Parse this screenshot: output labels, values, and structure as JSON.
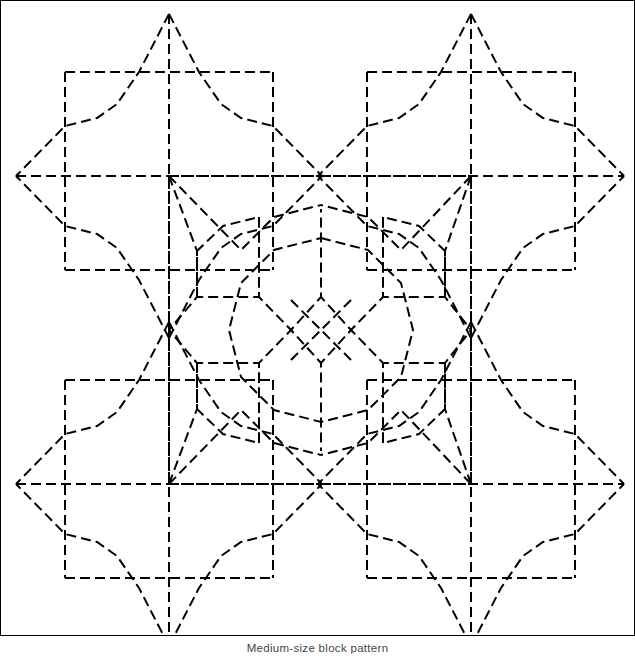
{
  "figure": {
    "caption": "Medium-size block pattern",
    "title": "Medium-size block pattern",
    "type": "geometric-line-drawing",
    "style": {
      "line_color": "#000000",
      "background_color": "#ffffff",
      "border_color": "#000000",
      "stroke_width": 2,
      "dash_length": 10,
      "dash_gap": 5
    },
    "canvas": {
      "width": 635,
      "height": 636
    },
    "geometry": {
      "description": "Two-by-two tiling of four-pointed star motifs with dashed squares and a central octagonal rosette",
      "motif_centers": [
        {
          "x": 168,
          "y": 175
        },
        {
          "x": 470,
          "y": 175
        },
        {
          "x": 168,
          "y": 483
        },
        {
          "x": 470,
          "y": 483
        }
      ],
      "star_point_radius_vertical": 162,
      "star_point_radius_horizontal": 153,
      "square_half_width": 104,
      "square_half_height": 99,
      "rosette_center": {
        "x": 320,
        "y": 329
      },
      "rosette_radius": 125,
      "crossing_nodes": [
        {
          "x": 320,
          "y": 175
        },
        {
          "x": 320,
          "y": 329
        },
        {
          "x": 320,
          "y": 483
        },
        {
          "x": 168,
          "y": 329
        },
        {
          "x": 470,
          "y": 329
        }
      ]
    }
  }
}
